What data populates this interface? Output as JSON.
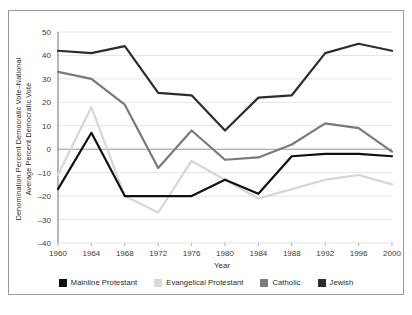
{
  "chart_data": {
    "type": "line",
    "title": "",
    "xlabel": "Year",
    "ylabel": "Denomination Percent Democratic Vote–National Average Percent Democratic Vote",
    "ylabel_line1": "Denomination Percent Democratic Vote–National",
    "ylabel_line2": "Average Percent Democratic Vote",
    "categories": [
      "1960",
      "1964",
      "1968",
      "1972",
      "1976",
      "1980",
      "1984",
      "1988",
      "1992",
      "1996",
      "2000"
    ],
    "x": [
      1960,
      1964,
      1968,
      1972,
      1976,
      1980,
      1984,
      1988,
      1992,
      1996,
      2000
    ],
    "ylim": [
      -40,
      50
    ],
    "yticks": [
      "50",
      "40",
      "30",
      "20",
      "10",
      "0",
      "-10",
      "-20",
      "-30",
      "-40"
    ],
    "ytick_values": [
      50,
      40,
      30,
      20,
      10,
      0,
      -10,
      -20,
      -30,
      -40
    ],
    "grid": true,
    "legend_position": "bottom",
    "series": [
      {
        "name": "Mainline Protestant",
        "color": "#101010",
        "values": [
          -17,
          7,
          -20,
          -20,
          -20,
          -13,
          -19,
          -3,
          -2,
          -2,
          -3
        ]
      },
      {
        "name": "Evangelical Protestant",
        "color": "#d6d6d6",
        "values": [
          -11,
          18,
          -20,
          -27,
          -5,
          -13,
          -21,
          -17,
          -13,
          -11,
          -15
        ]
      },
      {
        "name": "Catholic",
        "color": "#7a7a7a",
        "values": [
          33,
          30,
          19,
          -8,
          8,
          -4.5,
          -3.5,
          2,
          11,
          9,
          -1
        ]
      },
      {
        "name": "Jewish",
        "color": "#2d2d2d",
        "values": [
          42,
          41,
          44,
          24,
          23,
          8,
          22,
          23,
          41,
          45,
          42
        ]
      }
    ]
  },
  "legend": {
    "items": [
      {
        "label": "Mainline Protestant",
        "color": "#101010"
      },
      {
        "label": "Evangelical Protestant",
        "color": "#d9d9d9"
      },
      {
        "label": "Catholic",
        "color": "#7a7a7a"
      },
      {
        "label": "Jewish",
        "color": "#2d2d2d"
      }
    ]
  },
  "axes": {
    "x_title": "Year",
    "y_title_line1": "Denomination Percent Democratic Vote–National",
    "y_title_line2": "Average Percent Democratic Vote"
  }
}
